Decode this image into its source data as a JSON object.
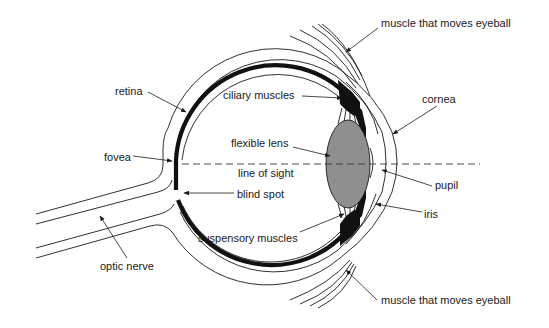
{
  "diagram": {
    "colors": {
      "ink": "#1a1a1a",
      "lens_fill": "#8f8f8f",
      "background": "#ffffff"
    },
    "labels": {
      "muscle_top": "muscle that moves eyeball",
      "retina": "retina",
      "ciliary_muscles": "ciliary muscles",
      "cornea": "cornea",
      "flexible_lens": "flexible lens",
      "fovea": "fovea",
      "line_of_sight": "line of sight",
      "pupil": "pupil",
      "blind_spot": "blind spot",
      "iris": "iris",
      "suspensory_muscles": "suspensory muscles",
      "optic_nerve": "optic nerve",
      "muscle_bottom": "muscle that moves eyeball"
    }
  }
}
